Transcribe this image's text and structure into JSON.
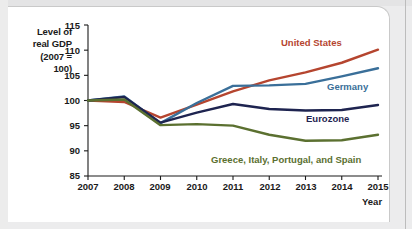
{
  "figure": {
    "background_color": "#ececed",
    "panel_color": "#ffffff"
  },
  "axis": {
    "y_title_lines": [
      "Level of",
      "real GDP",
      "(2007 =",
      "100)"
    ],
    "x_title": "Year",
    "y_ticks": [
      "115",
      "110",
      "105",
      "100",
      "95",
      "90",
      "85"
    ],
    "x_ticks": [
      "2007",
      "2008",
      "2009",
      "2010",
      "2011",
      "2012",
      "2013",
      "2014",
      "2015"
    ]
  },
  "labels": {
    "united_states": "United States",
    "germany": "Germany",
    "eurozone": "Eurozone",
    "gips": "Greece, Italy, Portugal, and Spain"
  },
  "colors": {
    "united_states": "#b5452f",
    "germany": "#3a6f99",
    "eurozone": "#1e2450",
    "gips": "#5b7030",
    "axis": "#1a1a1a"
  },
  "chart_data": {
    "type": "line",
    "title": "",
    "xlabel": "Year",
    "ylabel": "Level of real GDP (2007 = 100)",
    "x": [
      2007,
      2008,
      2009,
      2010,
      2011,
      2012,
      2013,
      2014,
      2015
    ],
    "xlim": [
      2007,
      2015
    ],
    "ylim": [
      85,
      115
    ],
    "yticks": [
      85,
      90,
      95,
      100,
      105,
      110,
      115
    ],
    "grid": false,
    "legend": "inline-labels",
    "series": [
      {
        "name": "United States",
        "color": "#b5452f",
        "values": [
          100.0,
          99.7,
          96.6,
          99.2,
          101.8,
          104.0,
          105.6,
          107.5,
          110.1
        ]
      },
      {
        "name": "Germany",
        "color": "#3a6f99",
        "values": [
          100.0,
          100.8,
          95.5,
          99.5,
          102.9,
          103.0,
          103.3,
          104.8,
          106.4
        ]
      },
      {
        "name": "Eurozone",
        "color": "#1e2450",
        "values": [
          100.0,
          100.7,
          95.6,
          97.6,
          99.3,
          98.3,
          98.0,
          98.1,
          99.1
        ]
      },
      {
        "name": "Greece, Italy, Portugal, and Spain",
        "color": "#5b7030",
        "values": [
          100.0,
          100.2,
          95.1,
          95.3,
          95.0,
          93.2,
          92.0,
          92.1,
          93.2
        ]
      }
    ]
  }
}
